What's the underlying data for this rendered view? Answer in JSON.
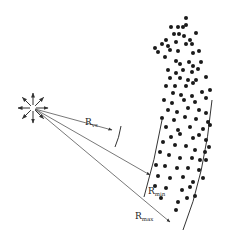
{
  "diagram": {
    "type": "radial-source-with-particle-cloud",
    "colors": {
      "ink": "#1a1a1a",
      "line": "#555555",
      "background": "#ffffff"
    },
    "source": {
      "cx": 33,
      "cy": 108,
      "ray_count": 8,
      "ray_length": 15
    },
    "arrows": [
      {
        "id": "r-vs",
        "label_main": "R",
        "label_sub": "vs",
        "x2": 112,
        "y2": 130,
        "lx": 85,
        "ly": 125
      },
      {
        "id": "r-min",
        "label_main": "R",
        "label_sub": "min",
        "x2": 150,
        "y2": 175,
        "lx": 148,
        "ly": 194
      },
      {
        "id": "r-max",
        "label_main": "R",
        "label_sub": "max",
        "x2": 170,
        "y2": 222,
        "lx": 135,
        "ly": 219
      }
    ],
    "arcs": [
      {
        "id": "arc-vs",
        "d": "M 121 126 Q 119 138 115 147"
      },
      {
        "id": "arc-inner",
        "d": "M 162 120 Q 155 160 144 197"
      },
      {
        "id": "arc-outer",
        "d": "M 212 100 Q 205 175 183 230"
      }
    ],
    "dots": [
      [
        186,
        18
      ],
      [
        171,
        27
      ],
      [
        178,
        27
      ],
      [
        183,
        27
      ],
      [
        186,
        25
      ],
      [
        162,
        44
      ],
      [
        166,
        40
      ],
      [
        174,
        34
      ],
      [
        179,
        34
      ],
      [
        184,
        36
      ],
      [
        190,
        40
      ],
      [
        196,
        33
      ],
      [
        155,
        48
      ],
      [
        168,
        46
      ],
      [
        176,
        42
      ],
      [
        186,
        44
      ],
      [
        192,
        44
      ],
      [
        158,
        52
      ],
      [
        170,
        50
      ],
      [
        178,
        51
      ],
      [
        193,
        53
      ],
      [
        199,
        51
      ],
      [
        165,
        57
      ],
      [
        176,
        61
      ],
      [
        180,
        64
      ],
      [
        189,
        62
      ],
      [
        193,
        66
      ],
      [
        201,
        62
      ],
      [
        168,
        70
      ],
      [
        176,
        73
      ],
      [
        183,
        70
      ],
      [
        192,
        72
      ],
      [
        198,
        69
      ],
      [
        170,
        78
      ],
      [
        180,
        78
      ],
      [
        188,
        80
      ],
      [
        196,
        80
      ],
      [
        206,
        77
      ],
      [
        166,
        86
      ],
      [
        175,
        86
      ],
      [
        186,
        86
      ],
      [
        193,
        83
      ],
      [
        173,
        93
      ],
      [
        181,
        95
      ],
      [
        192,
        96
      ],
      [
        202,
        92
      ],
      [
        164,
        100
      ],
      [
        172,
        103
      ],
      [
        184,
        100
      ],
      [
        195,
        102
      ],
      [
        206,
        98
      ],
      [
        210,
        90
      ],
      [
        168,
        110
      ],
      [
        177,
        112
      ],
      [
        188,
        108
      ],
      [
        199,
        110
      ],
      [
        206,
        113
      ],
      [
        162,
        118
      ],
      [
        174,
        120
      ],
      [
        185,
        117
      ],
      [
        196,
        119
      ],
      [
        208,
        122
      ],
      [
        166,
        127
      ],
      [
        178,
        130
      ],
      [
        190,
        127
      ],
      [
        203,
        129
      ],
      [
        210,
        125
      ],
      [
        171,
        137
      ],
      [
        180,
        134
      ],
      [
        193,
        138
      ],
      [
        199,
        135
      ],
      [
        206,
        140
      ],
      [
        163,
        142
      ],
      [
        175,
        145
      ],
      [
        186,
        146
      ],
      [
        195,
        150
      ],
      [
        205,
        152
      ],
      [
        209,
        147
      ],
      [
        160,
        152
      ],
      [
        169,
        155
      ],
      [
        180,
        158
      ],
      [
        192,
        158
      ],
      [
        200,
        160
      ],
      [
        206,
        160
      ],
      [
        156,
        165
      ],
      [
        165,
        166
      ],
      [
        177,
        168
      ],
      [
        188,
        168
      ],
      [
        199,
        170
      ],
      [
        158,
        176
      ],
      [
        170,
        178
      ],
      [
        183,
        177
      ],
      [
        193,
        182
      ],
      [
        203,
        178
      ],
      [
        155,
        186
      ],
      [
        166,
        188
      ],
      [
        182,
        190
      ],
      [
        190,
        187
      ],
      [
        195,
        196
      ],
      [
        161,
        198
      ],
      [
        178,
        202
      ],
      [
        187,
        198
      ],
      [
        176,
        210
      ]
    ]
  }
}
